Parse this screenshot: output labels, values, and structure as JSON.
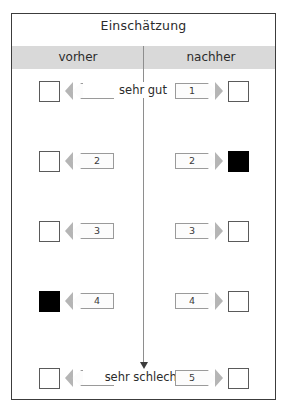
{
  "panel": {
    "title": "Einschätzung",
    "columns": {
      "before_label": "vorher",
      "after_label": "nachher"
    },
    "axis": {
      "top_anchor": "sehr gut",
      "bottom_anchor": "sehr schlecht",
      "direction_icon": "down-arrow-icon"
    },
    "rows": [
      {
        "value": "1",
        "left_tag": "1",
        "right_tag": "1",
        "left_checked": false,
        "right_checked": false,
        "anchor": "sehr gut"
      },
      {
        "value": "2",
        "left_tag": "2",
        "right_tag": "2",
        "left_checked": false,
        "right_checked": true,
        "anchor": ""
      },
      {
        "value": "3",
        "left_tag": "3",
        "right_tag": "3",
        "left_checked": false,
        "right_checked": false,
        "anchor": ""
      },
      {
        "value": "4",
        "left_tag": "4",
        "right_tag": "4",
        "left_checked": true,
        "right_checked": false,
        "anchor": ""
      },
      {
        "value": "5",
        "left_tag": "5",
        "right_tag": "5",
        "left_checked": false,
        "right_checked": false,
        "anchor": "sehr schlecht"
      }
    ]
  },
  "colors": {
    "border": "#3c3c3c",
    "header_band": "#d9d9d9",
    "checked_fill": "#000000",
    "tag_border": "#9a9a9a",
    "axis_line": "#8e8e8e"
  }
}
